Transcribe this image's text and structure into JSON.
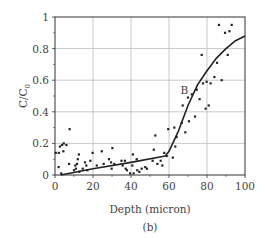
{
  "chart_data": {
    "type": "scatter",
    "title": "",
    "caption": "(b)",
    "xlabel": "Depth (micron)",
    "ylabel": "C/C0",
    "ylabel_main": "C/C",
    "ylabel_sub": "0",
    "xlim": [
      0,
      100
    ],
    "ylim": [
      0,
      1
    ],
    "xticks": [
      0,
      20,
      40,
      60,
      80,
      100
    ],
    "yticks": [
      0,
      0.2,
      0.4,
      0.6,
      0.8,
      1
    ],
    "xtick_labels": [
      "0",
      "20",
      "40",
      "60",
      "80",
      "100"
    ],
    "ytick_labels": [
      "0",
      "0.2",
      "0.4",
      "0.6",
      "0.8",
      "1"
    ],
    "grid": true,
    "annotations": [
      {
        "text": "B",
        "x": 66,
        "y": 0.54
      }
    ],
    "series": [
      {
        "name": "measured",
        "kind": "scatter",
        "points": [
          [
            0.4,
            0.14
          ],
          [
            2,
            0.14
          ],
          [
            2.6,
            0.18
          ],
          [
            3.7,
            0.19
          ],
          [
            4.6,
            0.2
          ],
          [
            4.4,
            0.15
          ],
          [
            6,
            0.19
          ],
          [
            1.9,
            0.05
          ],
          [
            3.3,
            0.01
          ],
          [
            7.7,
            0.29
          ],
          [
            7.4,
            0.07
          ],
          [
            10,
            0.03
          ],
          [
            10.7,
            0.06
          ],
          [
            11.6,
            0.07
          ],
          [
            12,
            0.1
          ],
          [
            12.6,
            0.13
          ],
          [
            11,
            0.04
          ],
          [
            12.8,
            0.02
          ],
          [
            14.6,
            0.04
          ],
          [
            15.8,
            0.08
          ],
          [
            16.5,
            0.06
          ],
          [
            17,
            0.03
          ],
          [
            18.6,
            0.09
          ],
          [
            19.8,
            0.14
          ],
          [
            22,
            0.06
          ],
          [
            24.6,
            0.15
          ],
          [
            25.6,
            0.07
          ],
          [
            28.4,
            0.1
          ],
          [
            29.5,
            0.08
          ],
          [
            29.8,
            0.04
          ],
          [
            30.2,
            0.17
          ],
          [
            31.2,
            0.07
          ],
          [
            35,
            0.09
          ],
          [
            35.6,
            0.06
          ],
          [
            36.8,
            0.09
          ],
          [
            37.2,
            0.04
          ],
          [
            37.9,
            0.03
          ],
          [
            39.5,
            0.01
          ],
          [
            40.7,
            0.06
          ],
          [
            41,
            0.13
          ],
          [
            41.4,
            0.01
          ],
          [
            43,
            0.1
          ],
          [
            43.3,
            0.03
          ],
          [
            44.4,
            0.02
          ],
          [
            45.6,
            0.04
          ],
          [
            47.5,
            0.05
          ],
          [
            48.4,
            0.04
          ],
          [
            51.4,
            0.09
          ],
          [
            52,
            0.16
          ],
          [
            52.8,
            0.25
          ],
          [
            53.9,
            0.07
          ],
          [
            55.6,
            0.09
          ],
          [
            56.5,
            0.06
          ],
          [
            57.5,
            0.14
          ],
          [
            58.8,
            0.12
          ],
          [
            59.6,
            0.29
          ],
          [
            62,
            0.11
          ],
          [
            62.8,
            0.3
          ],
          [
            63.3,
            0.18
          ],
          [
            64,
            0.24
          ],
          [
            66.7,
            0.33
          ],
          [
            67.2,
            0.44
          ],
          [
            68.6,
            0.27
          ],
          [
            70,
            0.49
          ],
          [
            70.5,
            0.34
          ],
          [
            72,
            0.51
          ],
          [
            73.7,
            0.37
          ],
          [
            74.6,
            0.54
          ],
          [
            76.1,
            0.48
          ],
          [
            77.2,
            0.76
          ],
          [
            77.9,
            0.58
          ],
          [
            79.3,
            0.42
          ],
          [
            79.8,
            0.59
          ],
          [
            80.9,
            0.44
          ],
          [
            81.9,
            0.58
          ],
          [
            83.9,
            0.62
          ],
          [
            85.3,
            0.71
          ],
          [
            86.3,
            0.95
          ],
          [
            87.7,
            0.6
          ],
          [
            89.5,
            0.9
          ],
          [
            90.9,
            0.76
          ],
          [
            91.8,
            0.91
          ],
          [
            93,
            0.95
          ]
        ]
      },
      {
        "name": "B (model curve)",
        "kind": "line",
        "points": [
          [
            3,
            0
          ],
          [
            20,
            0.04
          ],
          [
            40,
            0.08
          ],
          [
            58,
            0.12
          ],
          [
            60,
            0.15
          ],
          [
            65,
            0.28
          ],
          [
            70,
            0.44
          ],
          [
            75,
            0.57
          ],
          [
            80,
            0.66
          ],
          [
            85,
            0.74
          ],
          [
            90,
            0.8
          ],
          [
            95,
            0.85
          ],
          [
            100,
            0.88
          ]
        ]
      }
    ],
    "colors": {
      "grid": "#bbbbbb",
      "axis": "#333333",
      "points": "#222222",
      "line": "#222222",
      "text": "#444444"
    }
  }
}
